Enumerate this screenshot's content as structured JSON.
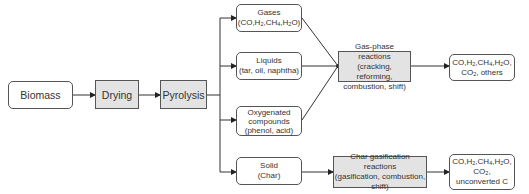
{
  "nodes": {
    "biomass": {
      "label": "Biomass"
    },
    "drying": {
      "label": "Drying"
    },
    "pyrolysis": {
      "label": "Pyrolysis"
    },
    "gases": {
      "line1": "Gases",
      "line2": "(CO,H2,CH4,H2O)"
    },
    "liquids": {
      "line1": "Liquids",
      "line2": "(tar, oil, naphtha)"
    },
    "oxygenated": {
      "line1": "Oxygenated",
      "line2": "compounds",
      "line3": "(phenol, acid)"
    },
    "solid": {
      "line1": "Solid",
      "line2": "(Char)"
    },
    "gas_phase": {
      "line1": "Gas-phase reactions",
      "line2": "(cracking, reforming,",
      "line3": "combustion, shift)"
    },
    "char_gasification": {
      "line1": "Char gasification reactions",
      "line2": "(gasification, combustion,",
      "line3": "shift)"
    },
    "gas_products": {
      "line1": "CO,H2,CH4,H2O,",
      "line2": "CO2, others"
    },
    "char_products": {
      "line1": "CO,H2,CH4,H2O,",
      "line2": "CO2,",
      "line3": "unconverted C"
    }
  },
  "colors": {
    "shaded": "#e3e3e3",
    "border": "#555555",
    "line": "#333333"
  }
}
